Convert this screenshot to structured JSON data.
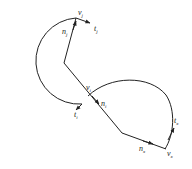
{
  "diagram": {
    "type": "geometric-path",
    "labels": {
      "vj": {
        "main": "v",
        "sub": "j"
      },
      "tj": {
        "main": "t",
        "sub": "j"
      },
      "nj": {
        "main": "n",
        "sub": "j"
      },
      "vi": {
        "main": "v",
        "sub": "i"
      },
      "ni": {
        "main": "n",
        "sub": "i"
      },
      "ti": {
        "main": "t",
        "sub": "i"
      },
      "tx": {
        "main": "t",
        "sub": "x"
      },
      "vx": {
        "main": "v",
        "sub": "x"
      },
      "nx": {
        "main": "n",
        "sub": "x"
      }
    },
    "colors": {
      "stroke": "#222222",
      "background": "#ffffff"
    }
  }
}
